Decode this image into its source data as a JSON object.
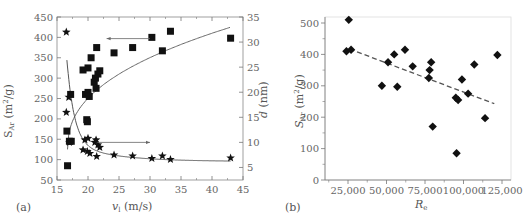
{
  "chart_data": [
    {
      "panel": "(a)",
      "type": "scatter",
      "xlabel": "v_l (m/s)",
      "ylabel_left": "S_Ar (m²/g)",
      "ylabel_right": "d (nm)",
      "xlim": [
        15,
        45
      ],
      "ylim_left": [
        50,
        450
      ],
      "ylim_right": [
        2.5,
        35
      ],
      "xticks": [
        15,
        20,
        25,
        30,
        35,
        40,
        45
      ],
      "yticks_left": [
        50,
        100,
        150,
        200,
        250,
        300,
        350,
        400,
        450
      ],
      "yticks_right": [
        5,
        10,
        15,
        20,
        25,
        30,
        35
      ],
      "grid": false,
      "series": [
        {
          "name": "S_Ar (squares, left axis)",
          "marker": "square",
          "axis": "left",
          "points": [
            [
              16.6,
              170
            ],
            [
              16.7,
              85
            ],
            [
              17.0,
              145
            ],
            [
              17.2,
              260
            ],
            [
              17.3,
              145
            ],
            [
              19.2,
              320
            ],
            [
              19.6,
              260
            ],
            [
              19.8,
              198
            ],
            [
              19.9,
              193
            ],
            [
              20.0,
              265
            ],
            [
              20.0,
              325
            ],
            [
              20.2,
              255
            ],
            [
              20.5,
              350
            ],
            [
              21.0,
              290
            ],
            [
              21.2,
              300
            ],
            [
              21.3,
              275
            ],
            [
              21.4,
              375
            ],
            [
              21.6,
              310
            ],
            [
              21.9,
              318
            ],
            [
              24.2,
              362
            ],
            [
              27.2,
              375
            ],
            [
              30.3,
              400
            ],
            [
              32.0,
              367
            ],
            [
              33.3,
              415
            ],
            [
              43.0,
              398
            ]
          ]
        },
        {
          "name": "d (stars, right axis)",
          "marker": "star",
          "axis": "right",
          "points": [
            [
              16.5,
              32
            ],
            [
              16.5,
              16
            ],
            [
              16.9,
              19
            ],
            [
              17.0,
              10
            ],
            [
              19.2,
              8.5
            ],
            [
              19.5,
              10.5
            ],
            [
              19.9,
              8.2
            ],
            [
              20.0,
              10.8
            ],
            [
              20.3,
              7.8
            ],
            [
              21.1,
              10
            ],
            [
              21.3,
              10.5
            ],
            [
              21.4,
              7.2
            ],
            [
              21.6,
              9.5
            ],
            [
              21.9,
              9
            ],
            [
              24.2,
              7.5
            ],
            [
              27.2,
              7.3
            ],
            [
              30.3,
              6.8
            ],
            [
              32.0,
              7.3
            ],
            [
              33.3,
              6.6
            ],
            [
              43.0,
              6.9
            ]
          ]
        }
      ],
      "fit_lines": [
        {
          "name": "S_Ar fit",
          "axis": "left",
          "description": "increasing log-like curve from (16.7,125) to (43,425)"
        },
        {
          "name": "d fit",
          "axis": "right",
          "description": "decreasing curve from (16.6,22.8) to (43,6.5)"
        }
      ],
      "annotations": [
        {
          "type": "arrow",
          "direction": "left",
          "from": [
            30,
            397
          ],
          "to": [
            23,
            397
          ],
          "meaning": "squares refer to left axis"
        },
        {
          "type": "arrow",
          "direction": "right",
          "from": [
            21.5,
            10
          ],
          "to": [
            30,
            10
          ],
          "meaning": "stars refer to right axis"
        }
      ]
    },
    {
      "panel": "(b)",
      "type": "scatter",
      "xlabel": "R_e",
      "ylabel": "S_Ar (m²/g)",
      "ylabel_outer": "d (nm)",
      "xlim": [
        10000,
        127000
      ],
      "ylim": [
        0,
        520
      ],
      "xticks": [
        25000,
        50000,
        75000,
        100000,
        125000
      ],
      "xtick_labels": [
        "25,000",
        "50,000",
        "75,000",
        "100,000",
        "125,000"
      ],
      "yticks": [
        0,
        100,
        200,
        300,
        400,
        500
      ],
      "grid": false,
      "series": [
        {
          "name": "S_Ar",
          "marker": "diamond",
          "points": [
            [
              24000,
              410
            ],
            [
              25500,
              510
            ],
            [
              27000,
              415
            ],
            [
              47000,
              300
            ],
            [
              51000,
              375
            ],
            [
              55000,
              400
            ],
            [
              57000,
              297
            ],
            [
              62000,
              415
            ],
            [
              67000,
              362
            ],
            [
              77500,
              325
            ],
            [
              78000,
              350
            ],
            [
              79000,
              375
            ],
            [
              80000,
              170
            ],
            [
              95000,
              262
            ],
            [
              95500,
              85
            ],
            [
              96500,
              255
            ],
            [
              99000,
              320
            ],
            [
              103000,
              275
            ],
            [
              107000,
              368
            ],
            [
              114000,
              197
            ],
            [
              122000,
              398
            ]
          ]
        }
      ],
      "fit_lines": [
        {
          "name": "linear fit",
          "style": "dashed",
          "from": [
            26000,
            417
          ],
          "to": [
            120000,
            243
          ]
        }
      ]
    }
  ],
  "panels": {
    "a": {
      "label": "(a)",
      "xlabel_main": "v",
      "xlabel_sub": "l",
      "xlabel_unit": " (m/s)",
      "ylabel_left_main": "S",
      "ylabel_left_sub": "Ar",
      "ylabel_left_unit": " (m",
      "ylabel_left_sup": "2",
      "ylabel_left_end": "/g)",
      "ylabel_right_main": "d",
      "ylabel_right_unit": " (nm)",
      "xticks": [
        "15",
        "20",
        "25",
        "30",
        "35",
        "40",
        "45"
      ],
      "yticks_left": [
        "50",
        "100",
        "150",
        "200",
        "250",
        "300",
        "350",
        "400",
        "450"
      ],
      "yticks_right": [
        "5",
        "10",
        "15",
        "20",
        "25",
        "30",
        "35"
      ]
    },
    "b": {
      "label": "(b)",
      "xlabel_main": "R",
      "xlabel_sub": "e",
      "ylabel_main": "S",
      "ylabel_sub": "Ar",
      "ylabel_unit": " (m",
      "ylabel_sup": "2",
      "ylabel_end": "/g)",
      "xticks": [
        "25,000",
        "50,000",
        "75,000",
        "100,000",
        "125,000"
      ],
      "yticks": [
        "0",
        "100",
        "200",
        "300",
        "400",
        "500"
      ]
    }
  },
  "colors": {
    "marker": "#111111",
    "axis": "#777777",
    "text": "#555555",
    "fit": "#666666"
  }
}
